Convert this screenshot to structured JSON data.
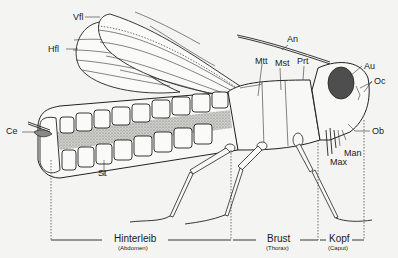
{
  "diagram": {
    "labels": {
      "vfl": "Vfl",
      "hfl": "Hfl",
      "an": "An",
      "mtt": "Mtt",
      "mst": "Mst",
      "prt": "Prt",
      "au": "Au",
      "oc": "Oc",
      "ob": "Ob",
      "man": "Man",
      "max": "Max",
      "ce": "Ce",
      "st": "St"
    },
    "sections": [
      {
        "name": "Hinterleib",
        "latin": "(Abdomen)"
      },
      {
        "name": "Brust",
        "latin": "(Thorax)"
      },
      {
        "name": "Kopf",
        "latin": "(Caput)"
      }
    ],
    "colors": {
      "ink": "#222222",
      "paper": "#f4f4f2",
      "stipple": "#9a9a96",
      "eye": "#555555"
    }
  }
}
